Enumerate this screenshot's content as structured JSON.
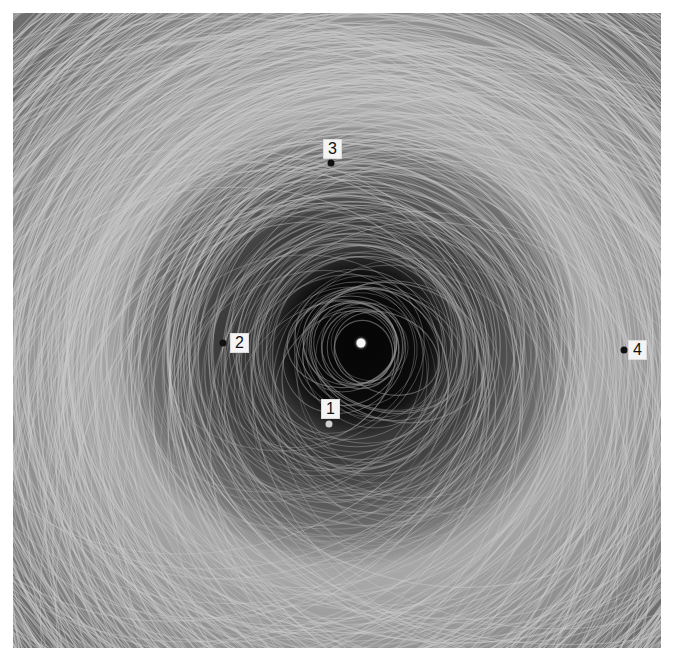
{
  "figure": {
    "background": "#ffffff",
    "center": {
      "x": 348,
      "y": 330,
      "color": "#f8f8f8"
    },
    "markers": [
      {
        "label": "1",
        "dot": {
          "x": 316,
          "y": 411
        },
        "dot_color": "#d0d0d0",
        "label_pos": {
          "x": 308,
          "y": 386
        }
      },
      {
        "label": "2",
        "dot": {
          "x": 210,
          "y": 330
        },
        "dot_color": "#111111",
        "label_pos": {
          "x": 217,
          "y": 320
        }
      },
      {
        "label": "3",
        "dot": {
          "x": 318,
          "y": 150
        },
        "dot_color": "#111111",
        "label_pos": {
          "x": 310,
          "y": 126
        }
      },
      {
        "label": "4",
        "dot": {
          "x": 611,
          "y": 337
        },
        "dot_color": "#111111",
        "label_pos": {
          "x": 615,
          "y": 327
        }
      }
    ]
  }
}
